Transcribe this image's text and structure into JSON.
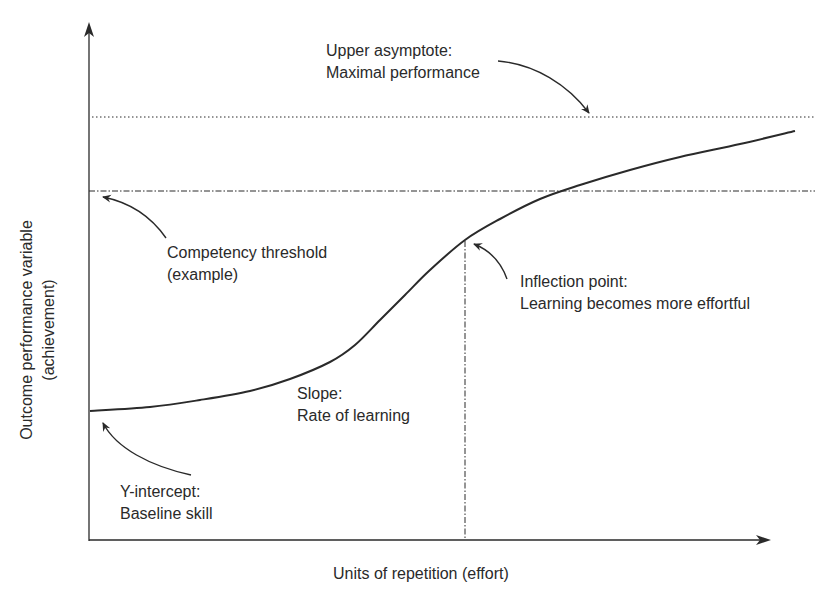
{
  "chart_data": {
    "type": "line",
    "title": "",
    "xlabel": "Units of repetition (effort)",
    "ylabel_line1": "Outcome performance variable",
    "ylabel_line2": "(achievement)",
    "grid": false,
    "legend": null,
    "curve": {
      "name": "Learning curve (sigmoid)",
      "points_px": [
        [
          90,
          411
        ],
        [
          150,
          407
        ],
        [
          200,
          400
        ],
        [
          250,
          391
        ],
        [
          290,
          379
        ],
        [
          330,
          362
        ],
        [
          355,
          345
        ],
        [
          380,
          320
        ],
        [
          405,
          295
        ],
        [
          430,
          270
        ],
        [
          465,
          240
        ],
        [
          500,
          219
        ],
        [
          540,
          199
        ],
        [
          580,
          185
        ],
        [
          630,
          170
        ],
        [
          680,
          157
        ],
        [
          740,
          144
        ],
        [
          795,
          131
        ]
      ]
    },
    "reference_lines": {
      "upper_asymptote_y_px": 117,
      "competency_threshold_y_px": 191,
      "inflection_x_px": 465
    },
    "annotations": [
      {
        "id": "upper_asymptote",
        "line1": "Upper asymptote:",
        "line2": "Maximal performance"
      },
      {
        "id": "competency_threshold",
        "line1": "Competency threshold",
        "line2": "(example)"
      },
      {
        "id": "inflection_point",
        "line1": "Inflection point:",
        "line2": "Learning becomes more effortful"
      },
      {
        "id": "slope",
        "line1": "Slope:",
        "line2": "Rate of learning"
      },
      {
        "id": "y_intercept",
        "line1": "Y-intercept:",
        "line2": "Baseline skill"
      }
    ]
  },
  "colors": {
    "ink": "#2a2a2a",
    "background": "#ffffff"
  }
}
